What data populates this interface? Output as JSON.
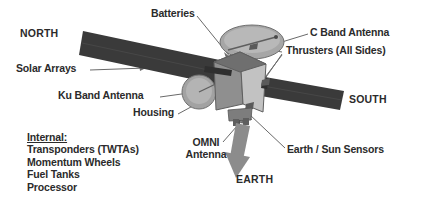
{
  "diagram": {
    "background_color": "#ffffff",
    "colors": {
      "solar_array": "#3a3a3a",
      "body_light": "#c9c9c9",
      "body_mid": "#9a9a9a",
      "body_dark": "#6e6e6e",
      "dish": "#9d9d9d",
      "dish_rim": "#7a7a7a",
      "arrow_gray": "#8c8c8c",
      "leader_line": "#6a6a6a",
      "text": "#2b2b2b"
    },
    "labels": {
      "north": "NORTH",
      "south": "SOUTH",
      "earth": "EARTH",
      "batteries": "Batteries",
      "c_band_antenna": "C Band Antenna",
      "thrusters": "Thrusters (All Sides)",
      "solar_arrays": "Solar Arrays",
      "ku_band_antenna": "Ku Band Antenna",
      "housing": "Housing",
      "omni_antenna_line1": "OMNI",
      "omni_antenna_line2": "Antenna",
      "earth_sun_sensors": "Earth / Sun Sensors"
    },
    "internal_list": {
      "heading": "Internal:",
      "items": [
        "Transponders (TWTAs)",
        "Momentum Wheels",
        "Fuel Tanks",
        "Processor"
      ]
    }
  }
}
